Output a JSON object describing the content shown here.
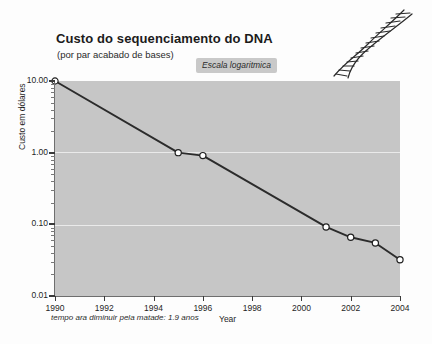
{
  "chart_data": {
    "type": "line",
    "title": "Custo do sequenciamento do DNA",
    "subtitle": "(por par acabado de bases)",
    "badge": "Escala logaritmica",
    "xlabel": "Year",
    "ylabel": "Custo em dólares",
    "footnote": "tempo ara diminuir pela matade: 1.9 anos",
    "yscale": "log",
    "ylim": [
      0.01,
      10.0
    ],
    "xlim": [
      1990,
      2004
    ],
    "grid": true,
    "grid_color": "#eaeaea",
    "legend": "none",
    "plot_bg": "#c6c6c6",
    "line_color": "#2b2b2b",
    "marker_face": "#ffffff",
    "marker_edge": "#1f1f1f",
    "x": [
      1990,
      1995,
      1996,
      2001,
      2002,
      2003,
      2004
    ],
    "values": [
      10.0,
      1.0,
      0.91,
      0.092,
      0.066,
      0.055,
      0.032
    ],
    "points": [
      {
        "year": 1990,
        "cost": 10.0
      },
      {
        "year": 1995,
        "cost": 1.0
      },
      {
        "year": 1996,
        "cost": 0.91
      },
      {
        "year": 2001,
        "cost": 0.092
      },
      {
        "year": 2002,
        "cost": 0.066
      },
      {
        "year": 2003,
        "cost": 0.055
      },
      {
        "year": 2004,
        "cost": 0.032
      }
    ],
    "ytick_labels": [
      "10.00",
      "1.00",
      "0.10",
      "0.01"
    ],
    "ytick_values": [
      10.0,
      1.0,
      0.1,
      0.01
    ],
    "xtick_labels": [
      "1990",
      "1992",
      "1994",
      "1996",
      "1998",
      "2000",
      "2002",
      "2004"
    ],
    "xtick_values": [
      1990,
      1992,
      1994,
      1996,
      1998,
      2000,
      2002,
      2004
    ]
  },
  "decoration": {
    "dna_icon_name": "dna-helix-icon"
  }
}
